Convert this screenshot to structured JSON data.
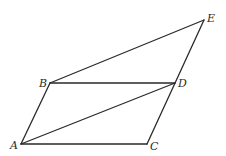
{
  "diagram": {
    "type": "geometry",
    "stroke_color": "#2a2a2a",
    "background": "#ffffff",
    "points": {
      "A": {
        "label": "A",
        "x": 21,
        "y": 144,
        "label_x": 10,
        "label_y": 149
      },
      "B": {
        "label": "B",
        "x": 50,
        "y": 83,
        "label_x": 39,
        "label_y": 87
      },
      "C": {
        "label": "C",
        "x": 147,
        "y": 144,
        "label_x": 150,
        "label_y": 150
      },
      "D": {
        "label": "D",
        "x": 175,
        "y": 83,
        "label_x": 178,
        "label_y": 87
      },
      "E": {
        "label": "E",
        "x": 204,
        "y": 20,
        "label_x": 207,
        "label_y": 22
      }
    },
    "segments": [
      {
        "name": "segment-AB",
        "from": "A",
        "to": "B"
      },
      {
        "name": "segment-AC",
        "from": "A",
        "to": "C"
      },
      {
        "name": "segment-BD",
        "from": "B",
        "to": "D"
      },
      {
        "name": "segment-AD",
        "from": "A",
        "to": "D"
      },
      {
        "name": "segment-CE",
        "from": "C",
        "to": "E"
      },
      {
        "name": "segment-BE",
        "from": "B",
        "to": "E"
      }
    ]
  }
}
